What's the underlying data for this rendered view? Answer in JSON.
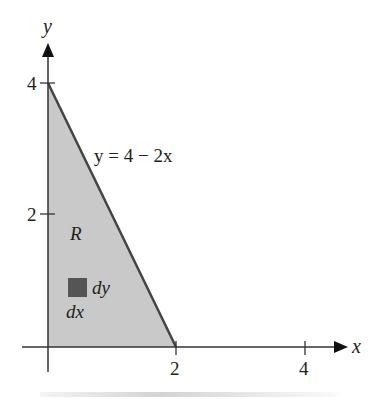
{
  "diagram": {
    "title": "",
    "axes": {
      "x_label": "x",
      "y_label": "y",
      "x_ticks": [
        {
          "value": 2,
          "label": "2"
        },
        {
          "value": 4,
          "label": "4"
        }
      ],
      "y_ticks": [
        {
          "value": 2,
          "label": "2"
        },
        {
          "value": 4,
          "label": "4"
        }
      ]
    },
    "curve_label": "y = 4 − 2x",
    "region_label": "R",
    "element_labels": {
      "dy": "dy",
      "dx": "dx"
    },
    "colors": {
      "region_fill": "#c9c9c9",
      "boundary": "#444444",
      "element": "#555555",
      "axes": "#333333"
    }
  }
}
